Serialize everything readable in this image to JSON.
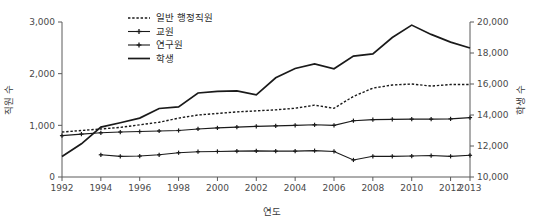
{
  "chart_data": {
    "type": "line",
    "title": "",
    "xlabel": "연도",
    "ylabel": "직원 수",
    "y2label": "학생 수",
    "grid": false,
    "legend_position": "top-center",
    "x": [
      1992,
      1993,
      1994,
      1995,
      1996,
      1997,
      1998,
      1999,
      2000,
      2001,
      2002,
      2003,
      2004,
      2005,
      2006,
      2007,
      2008,
      2009,
      2010,
      2011,
      2012,
      2013
    ],
    "xlim": [
      1992,
      2013
    ],
    "xticks": [
      1992,
      1994,
      1996,
      1998,
      2000,
      2002,
      2004,
      2006,
      2008,
      2010,
      2012,
      2013
    ],
    "xticklabels": [
      "1992",
      "1994",
      "1996",
      "1998",
      "2000",
      "2002",
      "2004",
      "2006",
      "2008",
      "2010",
      "2012",
      "2013"
    ],
    "ylim": [
      0,
      3000
    ],
    "yticks": [
      0,
      1000,
      2000,
      3000
    ],
    "yticklabels": [
      "0",
      "1,000",
      "2,000",
      "3,000"
    ],
    "y2lim": [
      10000,
      20000
    ],
    "y2ticks": [
      10000,
      12000,
      14000,
      16000,
      18000,
      20000
    ],
    "y2ticklabels": [
      "10,000",
      "12,000",
      "14,000",
      "16,000",
      "18,000",
      "20,000"
    ],
    "series": [
      {
        "name": "일반 행정직원",
        "axis": "left",
        "style": "dotted",
        "marker": "none",
        "values": [
          870,
          900,
          930,
          960,
          1010,
          1060,
          1140,
          1200,
          1230,
          1260,
          1280,
          1300,
          1330,
          1390,
          1330,
          1560,
          1720,
          1780,
          1800,
          1760,
          1790,
          1790
        ]
      },
      {
        "name": "교원",
        "axis": "left",
        "style": "solid",
        "marker": "plus",
        "values": [
          800,
          830,
          855,
          870,
          880,
          890,
          900,
          930,
          950,
          965,
          980,
          990,
          1000,
          1010,
          1000,
          1090,
          1110,
          1115,
          1120,
          1120,
          1125,
          1150
        ]
      },
      {
        "name": "연구원",
        "axis": "left",
        "style": "solid",
        "marker": "plus",
        "values": [
          null,
          null,
          430,
          400,
          405,
          430,
          470,
          490,
          495,
          500,
          505,
          500,
          500,
          510,
          495,
          330,
          400,
          400,
          405,
          415,
          400,
          420
        ]
      },
      {
        "name": "학생",
        "axis": "right",
        "style": "solid",
        "marker": "none",
        "values": [
          11320,
          12140,
          13220,
          13500,
          13800,
          14420,
          14520,
          15420,
          15520,
          15560,
          15300,
          16400,
          17000,
          17300,
          16980,
          17800,
          17940,
          19000,
          19800,
          19200,
          18700,
          18320
        ]
      }
    ]
  },
  "legend": {
    "items": [
      {
        "label": "일반 행정직원",
        "style": "dotted",
        "marker": "none"
      },
      {
        "label": "교원",
        "style": "solid",
        "marker": "plus"
      },
      {
        "label": "연구원",
        "style": "solid",
        "marker": "plus"
      },
      {
        "label": "학생",
        "style": "solid",
        "marker": "none"
      }
    ]
  }
}
